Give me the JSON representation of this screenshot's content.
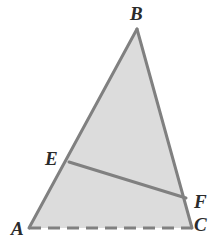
{
  "figure": {
    "background_color": "#ffffff",
    "fill_color": "#dcdcdc",
    "stroke_color": "#808080",
    "label_color": "#2b2b2b",
    "stroke_width": 3,
    "canvas": {
      "width": 224,
      "height": 242
    },
    "vertices": [
      {
        "id": "A",
        "label": "A",
        "x": 29,
        "y": 228
      },
      {
        "id": "B",
        "label": "B",
        "x": 137,
        "y": 29
      },
      {
        "id": "C",
        "label": "C",
        "x": 192,
        "y": 228
      },
      {
        "id": "E",
        "label": "E",
        "x": 69,
        "y": 162
      },
      {
        "id": "F",
        "label": "F",
        "x": 186,
        "y": 198
      }
    ],
    "labels": [
      {
        "id": "label-A",
        "text": "A",
        "x": 11,
        "y": 219
      },
      {
        "id": "label-B",
        "text": "B",
        "x": 130,
        "y": 4
      },
      {
        "id": "label-C",
        "text": "C",
        "x": 194,
        "y": 215
      },
      {
        "id": "label-E",
        "text": "E",
        "x": 45,
        "y": 149
      },
      {
        "id": "label-F",
        "text": "F",
        "x": 194,
        "y": 192
      }
    ],
    "edges": [
      {
        "id": "edge-AB",
        "from": "A",
        "to": "B",
        "style": "solid"
      },
      {
        "id": "edge-BC",
        "from": "B",
        "to": "C",
        "style": "solid"
      },
      {
        "id": "edge-AC",
        "from": "A",
        "to": "C",
        "style": "dashed"
      },
      {
        "id": "segment-EF",
        "from": "E",
        "to": "F",
        "style": "solid"
      }
    ],
    "dash_pattern": "12 7",
    "shaded_region": "A-B-C",
    "polygon_points": "29,228 137,29 192,228"
  }
}
